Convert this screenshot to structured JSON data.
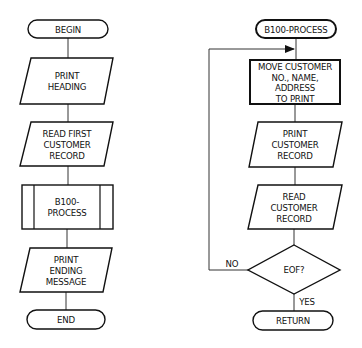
{
  "main_flow": {
    "begin": "BEGIN",
    "print_heading": [
      "PRINT",
      "HEADING"
    ],
    "read_first": [
      "READ FIRST",
      "CUSTOMER",
      "RECORD"
    ],
    "process_call": [
      "B100-",
      "PROCESS"
    ],
    "print_ending": [
      "PRINT",
      "ENDING",
      "MESSAGE"
    ],
    "end": "END"
  },
  "process_flow": {
    "start": "B100-PROCESS",
    "move": [
      "MOVE CUSTOMER",
      "NO., NAME,",
      "ADDRESS",
      "TO PRINT"
    ],
    "print_record": [
      "PRINT",
      "CUSTOMER",
      "RECORD"
    ],
    "read_record": [
      "READ",
      "CUSTOMER",
      "RECORD"
    ],
    "decision": "EOF?",
    "no_label": "NO",
    "yes_label": "YES",
    "return": "RETURN"
  },
  "colors": {
    "ink": "#111111",
    "line": "#333333",
    "background": "#ffffff"
  }
}
